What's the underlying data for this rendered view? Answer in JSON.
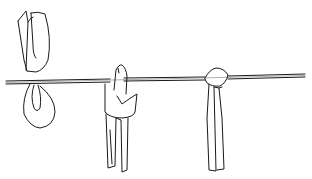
{
  "illustration": {
    "subject": "knots-on-rope line drawing",
    "stroke_color": "#1a1a1a",
    "background": "#ffffff",
    "figures": [
      {
        "name": "folded-loop-top",
        "description": "folded strap shown above rope"
      },
      {
        "name": "loop-below-rope",
        "description": "strap looped under rope"
      },
      {
        "name": "wrapped-knot",
        "description": "strap wrapped over rope with hanging ends"
      },
      {
        "name": "round-knot",
        "description": "rounded knot on rope with two hanging ends"
      }
    ]
  }
}
